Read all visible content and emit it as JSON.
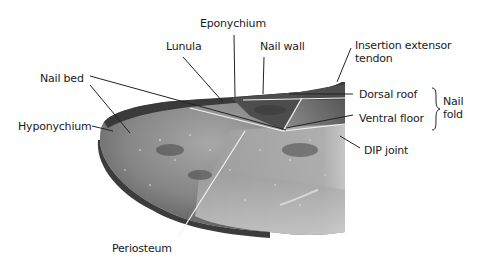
{
  "figure": {
    "labels": {
      "eponychium": "Eponychium",
      "lunula": "Lunula",
      "nail_wall": "Nail wall",
      "insertion_extensor_tendon_line1": "Insertion extensor",
      "insertion_extensor_tendon_line2": "tendon",
      "nail_bed": "Nail bed",
      "dorsal_roof": "Dorsal roof",
      "ventral_floor": "Ventral floor",
      "nail_fold_line1": "Nail",
      "nail_fold_line2": "fold",
      "hyponychium": "Hyponychium",
      "dip_joint": "DIP joint",
      "periosteum": "Periosteum"
    },
    "colors": {
      "background": "#ffffff",
      "text": "#1a1a1a",
      "leader_line": "#222222",
      "tissue_dark": "#3a3a3a",
      "tissue_mid": "#7a7a7a",
      "tissue_light": "#b5b5b5"
    }
  }
}
